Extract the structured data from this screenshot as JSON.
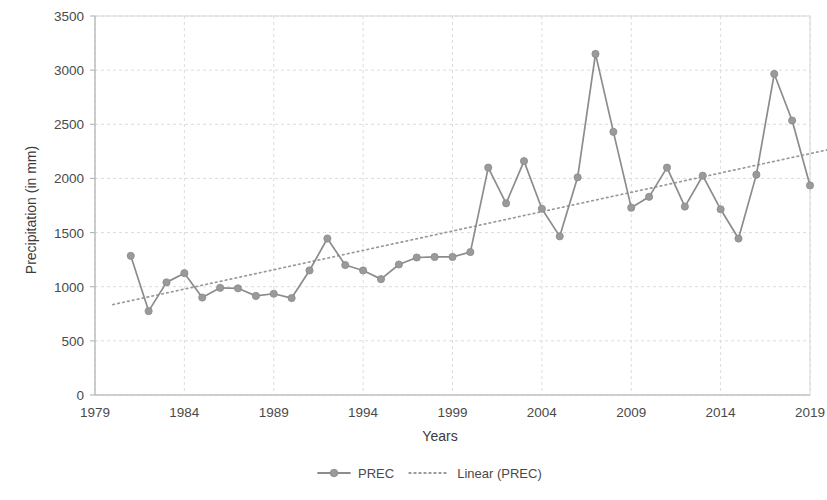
{
  "chart_data": {
    "type": "line",
    "title": "",
    "xlabel": "Years",
    "ylabel": "Precipitation (in mm)",
    "xlim": [
      1979,
      2019
    ],
    "ylim": [
      0,
      3500
    ],
    "ytick_step": 500,
    "xtick_step": 5,
    "grid": true,
    "legend_position": "bottom",
    "x": [
      1981,
      1982,
      1983,
      1984,
      1985,
      1986,
      1987,
      1988,
      1989,
      1990,
      1991,
      1992,
      1993,
      1994,
      1995,
      1996,
      1997,
      1998,
      1999,
      2000,
      2001,
      2002,
      2003,
      2004,
      2005,
      2006,
      2007,
      2008,
      2009,
      2010,
      2011,
      2012,
      2013,
      2014,
      2015,
      2016,
      2017,
      2018,
      2019
    ],
    "xtick_labels": [
      "1979",
      "1984",
      "1989",
      "1994",
      "1999",
      "2004",
      "2009",
      "2014",
      "2019"
    ],
    "ytick_labels": [
      "0",
      "500",
      "1000",
      "1500",
      "2000",
      "2500",
      "3000",
      "3500"
    ],
    "series": [
      {
        "name": "PREC",
        "kind": "line-marker",
        "color": "#8c8c8c",
        "values": [
          1285,
          775,
          1040,
          1125,
          900,
          990,
          985,
          915,
          935,
          895,
          1150,
          1445,
          1200,
          1150,
          1070,
          1205,
          1270,
          1275,
          1275,
          1320,
          2100,
          1770,
          2160,
          1720,
          1465,
          2010,
          3150,
          2430,
          1730,
          1830,
          2100,
          1740,
          2025,
          1715,
          1445,
          2035,
          2965,
          2535,
          1935
        ]
      },
      {
        "name": "Linear (PREC)",
        "kind": "trendline",
        "color": "#9a9a9a",
        "endpoints": [
          {
            "x": 1980,
            "y": 835
          },
          {
            "x": 2020,
            "y": 2265
          }
        ]
      }
    ],
    "legend": [
      {
        "label": "PREC",
        "marker": "line-with-circle",
        "color": "#8c8c8c"
      },
      {
        "label": "Linear (PREC)",
        "marker": "dotted-line",
        "color": "#9a9a9a"
      }
    ]
  }
}
